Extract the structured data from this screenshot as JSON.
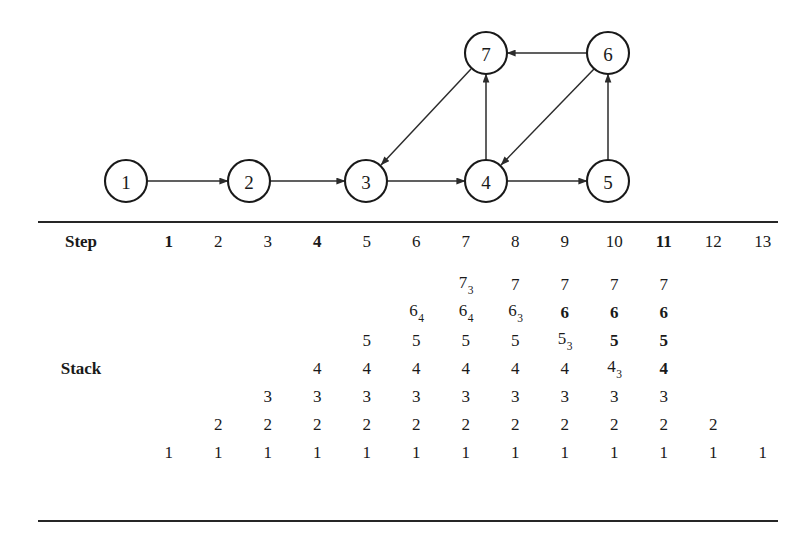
{
  "graph": {
    "title": "directed-graph",
    "nodes": [
      {
        "id": "n1",
        "label": "1",
        "cx": 126,
        "cy": 181
      },
      {
        "id": "n2",
        "label": "2",
        "cx": 249,
        "cy": 181
      },
      {
        "id": "n3",
        "label": "3",
        "cx": 366,
        "cy": 181
      },
      {
        "id": "n4",
        "label": "4",
        "cx": 486,
        "cy": 181
      },
      {
        "id": "n5",
        "label": "5",
        "cx": 608,
        "cy": 181
      },
      {
        "id": "n6",
        "label": "6",
        "cx": 608,
        "cy": 53
      },
      {
        "id": "n7",
        "label": "7",
        "cx": 486,
        "cy": 53
      }
    ],
    "radius": 21,
    "edges": [
      {
        "from": "1",
        "to": "2"
      },
      {
        "from": "2",
        "to": "3"
      },
      {
        "from": "3",
        "to": "4"
      },
      {
        "from": "4",
        "to": "5"
      },
      {
        "from": "4",
        "to": "7"
      },
      {
        "from": "5",
        "to": "6"
      },
      {
        "from": "6",
        "to": "7"
      },
      {
        "from": "6",
        "to": "4"
      },
      {
        "from": "7",
        "to": "3"
      }
    ]
  },
  "table": {
    "step_label": "Step",
    "stack_label": "Stack",
    "steps": [
      {
        "label": "1",
        "bold": true
      },
      {
        "label": "2",
        "bold": false
      },
      {
        "label": "3",
        "bold": false
      },
      {
        "label": "4",
        "bold": true
      },
      {
        "label": "5",
        "bold": false
      },
      {
        "label": "6",
        "bold": false
      },
      {
        "label": "7",
        "bold": false
      },
      {
        "label": "8",
        "bold": false
      },
      {
        "label": "9",
        "bold": false
      },
      {
        "label": "10",
        "bold": false
      },
      {
        "label": "11",
        "bold": true
      },
      {
        "label": "12",
        "bold": false
      },
      {
        "label": "13",
        "bold": false
      }
    ],
    "stack_rows": [
      {
        "name": "row-7",
        "cells": [
          "",
          "",
          "",
          "",
          "",
          "",
          "7|3",
          "7",
          "7",
          "7",
          "7",
          "",
          ""
        ]
      },
      {
        "name": "row-6",
        "cells": [
          "",
          "",
          "",
          "",
          "",
          "6|4",
          "6|4",
          "6|3",
          "*6",
          "*6",
          "*6",
          "",
          ""
        ]
      },
      {
        "name": "row-5",
        "cells": [
          "",
          "",
          "",
          "",
          "5",
          "5",
          "5",
          "5",
          "5|3",
          "*5",
          "*5",
          "",
          ""
        ]
      },
      {
        "name": "row-4",
        "cells": [
          "",
          "",
          "",
          "4",
          "4",
          "4",
          "4",
          "4",
          "4",
          "4|3",
          "*4",
          "",
          ""
        ]
      },
      {
        "name": "row-3",
        "cells": [
          "",
          "",
          "3",
          "3",
          "3",
          "3",
          "3",
          "3",
          "3",
          "3",
          "3",
          "",
          ""
        ]
      },
      {
        "name": "row-2",
        "cells": [
          "",
          "2",
          "2",
          "2",
          "2",
          "2",
          "2",
          "2",
          "2",
          "2",
          "2",
          "2",
          ""
        ]
      },
      {
        "name": "row-1",
        "cells": [
          "1",
          "1",
          "1",
          "1",
          "1",
          "1",
          "1",
          "1",
          "1",
          "1",
          "1",
          "1",
          "1"
        ]
      }
    ],
    "stack_label_row_index": 3
  },
  "colors": {
    "ink": "#1a1a1a",
    "rule": "#262626",
    "stroke": "#191919",
    "background": "#ffffff"
  }
}
